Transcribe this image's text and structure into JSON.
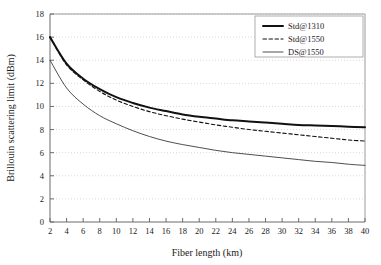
{
  "chart_data": {
    "type": "line",
    "title": "",
    "xlabel": "Fiber length (km)",
    "ylabel": "Brillouin scattering limit (dBm)",
    "xlim": [
      2,
      40
    ],
    "ylim": [
      0,
      18
    ],
    "xticks": [
      2,
      4,
      6,
      8,
      10,
      12,
      14,
      16,
      18,
      20,
      22,
      24,
      26,
      28,
      30,
      32,
      34,
      36,
      38,
      40
    ],
    "yticks": [
      0,
      2,
      4,
      6,
      8,
      10,
      12,
      14,
      16,
      18
    ],
    "grid": "horizontal-dotted",
    "legend_position": "top-right-inside",
    "x": [
      2,
      4,
      6,
      8,
      10,
      12,
      14,
      16,
      18,
      20,
      22,
      24,
      26,
      28,
      30,
      32,
      34,
      36,
      38,
      40
    ],
    "series": [
      {
        "name": "Std@1310",
        "style": "solid-thick",
        "color": "#111111",
        "width": 2.0,
        "values": [
          16.0,
          13.7,
          12.4,
          11.5,
          10.8,
          10.3,
          9.9,
          9.6,
          9.3,
          9.1,
          8.95,
          8.8,
          8.7,
          8.6,
          8.5,
          8.4,
          8.35,
          8.3,
          8.25,
          8.2
        ]
      },
      {
        "name": "Std@1550",
        "style": "dashed",
        "color": "#111111",
        "width": 1.1,
        "values": [
          16.0,
          13.6,
          12.3,
          11.3,
          10.55,
          10.0,
          9.55,
          9.2,
          8.9,
          8.65,
          8.4,
          8.2,
          8.0,
          7.85,
          7.7,
          7.55,
          7.4,
          7.25,
          7.1,
          7.0
        ]
      },
      {
        "name": "DS@1550",
        "style": "solid-thin",
        "color": "#3a3a3a",
        "width": 0.9,
        "values": [
          14.0,
          11.6,
          10.2,
          9.2,
          8.5,
          7.9,
          7.4,
          7.0,
          6.7,
          6.45,
          6.2,
          6.0,
          5.85,
          5.7,
          5.55,
          5.4,
          5.25,
          5.15,
          5.0,
          4.9
        ]
      }
    ]
  },
  "legend": {
    "entries": [
      {
        "label": "Std@1310"
      },
      {
        "label": "Std@1550"
      },
      {
        "label": "DS@1550"
      }
    ]
  }
}
